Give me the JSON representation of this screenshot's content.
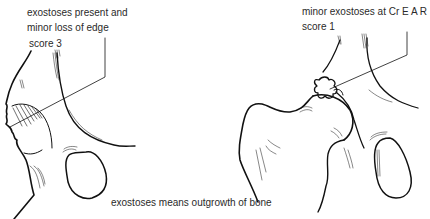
{
  "annotations": {
    "left": {
      "lines": [
        "exostoses present and",
        "minor loss of edge",
        "score 3"
      ]
    },
    "right": {
      "lines": [
        "minor exostoses at Cr E A R",
        "score 1"
      ]
    },
    "footnote": "exostoses means outgrowth of bone"
  },
  "figures": [
    {
      "name": "left-hip-joint",
      "description": "acetabulum edge with exostoses and edge loss, score 3"
    },
    {
      "name": "right-hip-joint",
      "description": "femoral head with minor exostoses at cranial edge of acetabular rim, score 1"
    }
  ],
  "colors": {
    "ink": "#111111",
    "text": "#2a2a2a",
    "background": "#ffffff"
  }
}
